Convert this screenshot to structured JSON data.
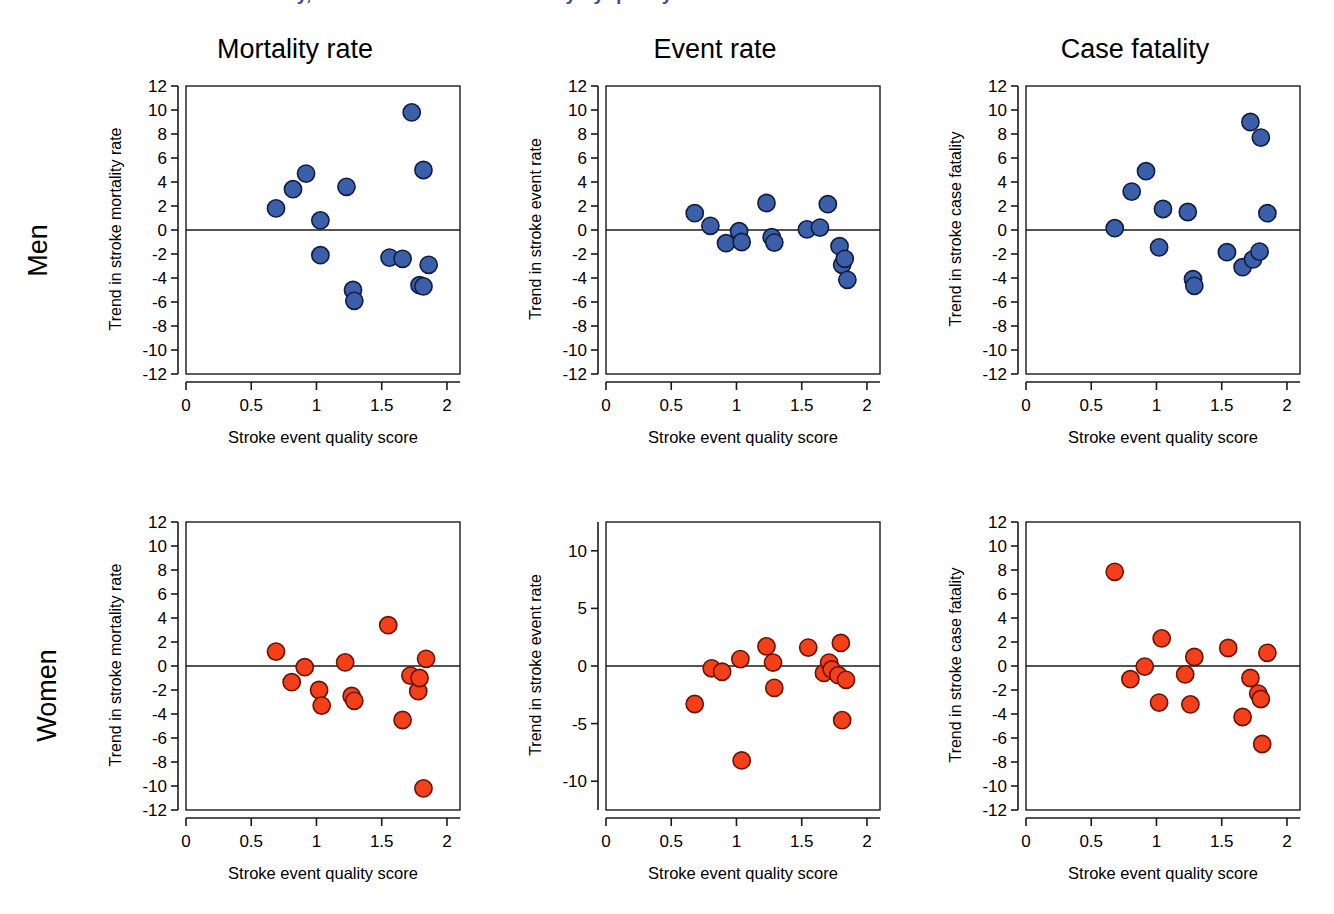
{
  "figure": {
    "supertitle_clipped": "Trends in stroke mortality, event rates and case fatality by quality score",
    "row_labels": [
      "Men",
      "Women"
    ],
    "colors": {
      "men_marker_fill": "#3B5FA8",
      "men_marker_stroke": "#101C42",
      "women_marker_fill": "#F4401A",
      "women_marker_stroke": "#6B1203",
      "axis": "#1a1a1a",
      "supertitle": "#3B4C8C"
    },
    "xlabel": "Stroke event quality score",
    "column_titles": [
      "Mortality rate",
      "Event rate",
      "Case fatality"
    ]
  },
  "chart_data": [
    {
      "id": "men-mortality",
      "type": "scatter",
      "title": "Mortality rate",
      "row": "Men",
      "xlabel": "Stroke event quality score",
      "ylabel": "Trend in stroke mortality rate",
      "xlim": [
        0,
        2.1
      ],
      "ylim": [
        -12,
        12
      ],
      "xticks": [
        0,
        0.5,
        1,
        1.5,
        2
      ],
      "xticklabels": [
        "0",
        "0.5",
        "1",
        "1.5",
        "2"
      ],
      "yticks": [
        12,
        10,
        8,
        6,
        4,
        2,
        0,
        -2,
        -4,
        -6,
        -8,
        -10,
        -12
      ],
      "yticklabels": [
        "12",
        "10",
        "8",
        "6",
        "4",
        "2",
        "0",
        "-2",
        "-4",
        "-6",
        "-8",
        "-10",
        "-12"
      ],
      "zero_line": 0,
      "grid": false,
      "marker_color": "#3B5FA8",
      "points": [
        {
          "x": 0.69,
          "y": 1.8
        },
        {
          "x": 0.82,
          "y": 3.4
        },
        {
          "x": 0.92,
          "y": 4.7
        },
        {
          "x": 1.03,
          "y": 0.8
        },
        {
          "x": 1.23,
          "y": 3.6
        },
        {
          "x": 1.73,
          "y": 9.8
        },
        {
          "x": 1.82,
          "y": 5.0
        },
        {
          "x": 1.03,
          "y": -2.1
        },
        {
          "x": 1.28,
          "y": -5.0
        },
        {
          "x": 1.29,
          "y": -5.9
        },
        {
          "x": 1.56,
          "y": -2.3
        },
        {
          "x": 1.66,
          "y": -2.4
        },
        {
          "x": 1.79,
          "y": -4.6
        },
        {
          "x": 1.82,
          "y": -4.7
        },
        {
          "x": 1.86,
          "y": -2.9
        }
      ]
    },
    {
      "id": "men-event",
      "type": "scatter",
      "title": "Event rate",
      "row": "Men",
      "xlabel": "Stroke event quality score",
      "ylabel": "Trend in stroke event rate",
      "xlim": [
        0,
        2.1
      ],
      "ylim": [
        -12,
        12
      ],
      "xticks": [
        0,
        0.5,
        1,
        1.5,
        2
      ],
      "xticklabels": [
        "0",
        "0.5",
        "1",
        "1.5",
        "2"
      ],
      "yticks": [
        12,
        10,
        8,
        6,
        4,
        2,
        0,
        -2,
        -4,
        -6,
        -8,
        -10,
        -12
      ],
      "yticklabels": [
        "12",
        "10",
        "8",
        "6",
        "4",
        "2",
        "0",
        "-2",
        "-4",
        "-6",
        "-8",
        "-10",
        "-12"
      ],
      "zero_line": 0,
      "grid": false,
      "marker_color": "#3B5FA8",
      "points": [
        {
          "x": 0.68,
          "y": 1.4
        },
        {
          "x": 0.8,
          "y": 0.35
        },
        {
          "x": 0.92,
          "y": -1.1
        },
        {
          "x": 1.02,
          "y": -0.1
        },
        {
          "x": 1.04,
          "y": -1.0
        },
        {
          "x": 1.23,
          "y": 2.25
        },
        {
          "x": 1.27,
          "y": -0.6
        },
        {
          "x": 1.29,
          "y": -1.05
        },
        {
          "x": 1.54,
          "y": 0.05
        },
        {
          "x": 1.64,
          "y": 0.2
        },
        {
          "x": 1.7,
          "y": 2.15
        },
        {
          "x": 1.79,
          "y": -1.35
        },
        {
          "x": 1.81,
          "y": -2.9
        },
        {
          "x": 1.83,
          "y": -2.4
        },
        {
          "x": 1.85,
          "y": -4.15
        }
      ]
    },
    {
      "id": "men-fatality",
      "type": "scatter",
      "title": "Case fatality",
      "row": "Men",
      "xlabel": "Stroke event quality score",
      "ylabel": "Trend in stroke case fatality",
      "xlim": [
        0,
        2.1
      ],
      "ylim": [
        -12,
        12
      ],
      "xticks": [
        0,
        0.5,
        1,
        1.5,
        2
      ],
      "xticklabels": [
        "0",
        "0.5",
        "1",
        "1.5",
        "2"
      ],
      "yticks": [
        12,
        10,
        8,
        6,
        4,
        2,
        0,
        -2,
        -4,
        -6,
        -8,
        -10,
        -12
      ],
      "yticklabels": [
        "12",
        "10",
        "8",
        "6",
        "4",
        "2",
        "0",
        "-2",
        "-4",
        "-6",
        "-8",
        "-10",
        "-12"
      ],
      "zero_line": 0,
      "grid": false,
      "marker_color": "#3B5FA8",
      "points": [
        {
          "x": 0.68,
          "y": 0.15
        },
        {
          "x": 0.81,
          "y": 3.2
        },
        {
          "x": 0.92,
          "y": 4.9
        },
        {
          "x": 1.02,
          "y": -1.45
        },
        {
          "x": 1.05,
          "y": 1.75
        },
        {
          "x": 1.24,
          "y": 1.5
        },
        {
          "x": 1.28,
          "y": -4.1
        },
        {
          "x": 1.29,
          "y": -4.65
        },
        {
          "x": 1.54,
          "y": -1.85
        },
        {
          "x": 1.66,
          "y": -3.1
        },
        {
          "x": 1.72,
          "y": 9.0
        },
        {
          "x": 1.74,
          "y": -2.45
        },
        {
          "x": 1.79,
          "y": -1.8
        },
        {
          "x": 1.8,
          "y": 7.7
        },
        {
          "x": 1.85,
          "y": 1.4
        }
      ]
    },
    {
      "id": "women-mortality",
      "type": "scatter",
      "title": "Mortality rate",
      "row": "Women",
      "xlabel": "Stroke event quality score",
      "ylabel": "Trend in stroke mortality rate",
      "xlim": [
        0,
        2.1
      ],
      "ylim": [
        -12,
        12
      ],
      "xticks": [
        0,
        0.5,
        1,
        1.5,
        2
      ],
      "xticklabels": [
        "0",
        "0.5",
        "1",
        "1.5",
        "2"
      ],
      "yticks": [
        12,
        10,
        8,
        6,
        4,
        2,
        0,
        -2,
        -4,
        -6,
        -8,
        -10,
        -12
      ],
      "yticklabels": [
        "12",
        "10",
        "8",
        "6",
        "4",
        "2",
        "0",
        "-2",
        "-4",
        "-6",
        "-8",
        "-10",
        "-12"
      ],
      "zero_line": 0,
      "grid": false,
      "marker_color": "#F4401A",
      "points": [
        {
          "x": 0.69,
          "y": 1.2
        },
        {
          "x": 0.81,
          "y": -1.35
        },
        {
          "x": 0.91,
          "y": -0.1
        },
        {
          "x": 1.02,
          "y": -2.0
        },
        {
          "x": 1.04,
          "y": -3.3
        },
        {
          "x": 1.22,
          "y": 0.3
        },
        {
          "x": 1.27,
          "y": -2.5
        },
        {
          "x": 1.29,
          "y": -2.9
        },
        {
          "x": 1.55,
          "y": 3.4
        },
        {
          "x": 1.66,
          "y": -4.5
        },
        {
          "x": 1.72,
          "y": -0.8
        },
        {
          "x": 1.78,
          "y": -2.1
        },
        {
          "x": 1.79,
          "y": -1.0
        },
        {
          "x": 1.82,
          "y": -10.2
        },
        {
          "x": 1.84,
          "y": 0.6
        }
      ]
    },
    {
      "id": "women-event",
      "type": "scatter",
      "title": "Event rate",
      "row": "Women",
      "xlabel": "Stroke event quality score",
      "ylabel": "Trend in stroke event rate",
      "xlim": [
        0,
        2.1
      ],
      "ylim": [
        -12.5,
        12.5
      ],
      "xticks": [
        0,
        0.5,
        1,
        1.5,
        2
      ],
      "xticklabels": [
        "0",
        "0.5",
        "1",
        "1.5",
        "2"
      ],
      "yticks": [
        10,
        5,
        0,
        -5,
        -10
      ],
      "yticklabels": [
        "10",
        "5",
        "0",
        "-5",
        "-10"
      ],
      "zero_line": 0,
      "grid": false,
      "marker_color": "#F4401A",
      "points": [
        {
          "x": 0.68,
          "y": -3.3
        },
        {
          "x": 0.81,
          "y": -0.2
        },
        {
          "x": 0.89,
          "y": -0.5
        },
        {
          "x": 1.03,
          "y": 0.6
        },
        {
          "x": 1.04,
          "y": -8.2
        },
        {
          "x": 1.23,
          "y": 1.7
        },
        {
          "x": 1.28,
          "y": 0.3
        },
        {
          "x": 1.29,
          "y": -1.9
        },
        {
          "x": 1.55,
          "y": 1.6
        },
        {
          "x": 1.67,
          "y": -0.6
        },
        {
          "x": 1.71,
          "y": 0.3
        },
        {
          "x": 1.73,
          "y": -0.3
        },
        {
          "x": 1.78,
          "y": -0.8
        },
        {
          "x": 1.8,
          "y": 2.0
        },
        {
          "x": 1.81,
          "y": -4.7
        },
        {
          "x": 1.84,
          "y": -1.2
        }
      ]
    },
    {
      "id": "women-fatality",
      "type": "scatter",
      "title": "Case fatality",
      "row": "Women",
      "xlabel": "Stroke event quality score",
      "ylabel": "Trend in stroke case fatality",
      "xlim": [
        0,
        2.1
      ],
      "ylim": [
        -12,
        12
      ],
      "xticks": [
        0,
        0.5,
        1,
        1.5,
        2
      ],
      "xticklabels": [
        "0",
        "0.5",
        "1",
        "1.5",
        "2"
      ],
      "yticks": [
        12,
        10,
        8,
        6,
        4,
        2,
        0,
        -2,
        -4,
        -6,
        -8,
        -10,
        -12
      ],
      "yticklabels": [
        "12",
        "10",
        "8",
        "6",
        "4",
        "2",
        "0",
        "-2",
        "-4",
        "-6",
        "-8",
        "-10",
        "-12"
      ],
      "zero_line": 0,
      "grid": false,
      "marker_color": "#F4401A",
      "points": [
        {
          "x": 0.68,
          "y": 7.85
        },
        {
          "x": 0.8,
          "y": -1.1
        },
        {
          "x": 0.91,
          "y": -0.05
        },
        {
          "x": 1.02,
          "y": -3.05
        },
        {
          "x": 1.04,
          "y": 2.3
        },
        {
          "x": 1.22,
          "y": -0.7
        },
        {
          "x": 1.26,
          "y": -3.2
        },
        {
          "x": 1.29,
          "y": 0.75
        },
        {
          "x": 1.55,
          "y": 1.5
        },
        {
          "x": 1.66,
          "y": -4.25
        },
        {
          "x": 1.72,
          "y": -1.0
        },
        {
          "x": 1.78,
          "y": -2.3
        },
        {
          "x": 1.8,
          "y": -2.75
        },
        {
          "x": 1.81,
          "y": -6.5
        },
        {
          "x": 1.85,
          "y": 1.1
        }
      ]
    }
  ]
}
